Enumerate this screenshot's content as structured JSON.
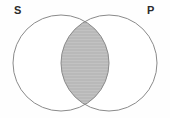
{
  "figure": {
    "type": "venn-diagram",
    "title": "",
    "background_color": "#fefefe",
    "stroke_color": "#8a8a8a",
    "stroke_width": 1,
    "shaded_region": "intersection",
    "shaded_fill_color": "#b9b9b9",
    "shaded_stroke_color": "#7d7d7d",
    "label_color": "#2b2b2b"
  },
  "labels": {
    "subject": "S",
    "predicate": "P"
  },
  "circles": [
    {
      "name": "subject-circle",
      "label": "S",
      "cx": 61,
      "cy": 63,
      "r": 48,
      "fill": "#ffffff"
    },
    {
      "name": "predicate-circle",
      "label": "P",
      "cx": 109,
      "cy": 63,
      "r": 48,
      "fill": "#ffffff"
    }
  ],
  "regions": [
    {
      "name": "s-only",
      "shaded": false
    },
    {
      "name": "s-and-p",
      "shaded": true
    },
    {
      "name": "p-only",
      "shaded": false
    }
  ]
}
